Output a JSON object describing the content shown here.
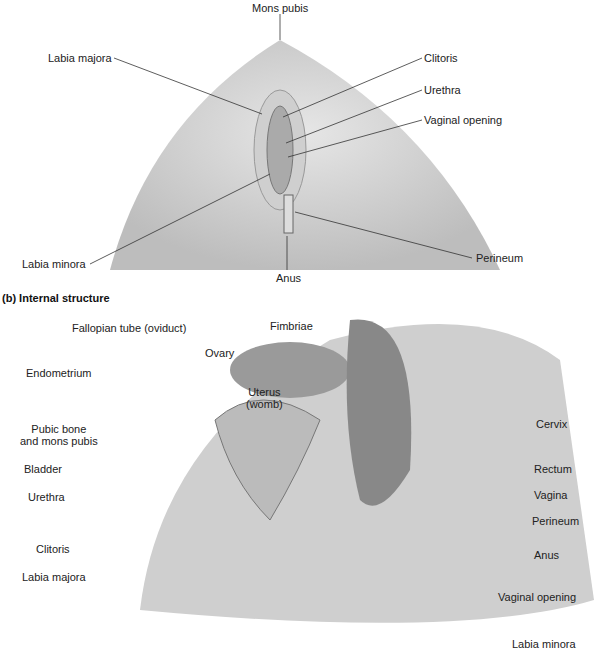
{
  "external": {
    "labels": [
      "Mons pubis",
      "Labia majora",
      "Clitoris",
      "Urethra",
      "Vaginal opening",
      "Labia minora",
      "Perineum",
      "Anus"
    ]
  },
  "internal": {
    "title": "(b) Internal structure",
    "labels": [
      "Fallopian tube (oviduct)",
      "Fimbriae",
      "Ovary",
      "Endometrium",
      "Uterus\n(womb)",
      "Pubic bone\nand mons pubis",
      "Bladder",
      "Urethra",
      "Clitoris",
      "Labia majora",
      "Cervix",
      "Rectum",
      "Vagina",
      "Perineum",
      "Anus",
      "Vaginal opening",
      "Labia minora"
    ]
  }
}
